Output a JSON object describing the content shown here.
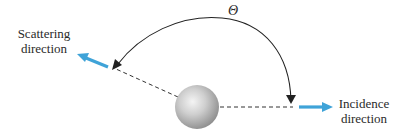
{
  "diagram": {
    "type": "scattering-geometry",
    "angle_symbol": "Θ",
    "labels": {
      "scattering": {
        "line1": "Scattering",
        "line2": "direction"
      },
      "incidence": {
        "line1": "Incidence",
        "line2": "direction"
      }
    },
    "elements": {
      "particle": "sphere",
      "arrows": [
        "scattering-direction-arrow",
        "incidence-direction-arrow"
      ],
      "angle_arc": "scattering-angle-arc"
    },
    "colors": {
      "arrow": "#3fa3d8",
      "line": "#333333",
      "sphere_light": "#f2f2f2",
      "sphere_dark": "#8c8c8c",
      "text": "#2a2a2a"
    }
  }
}
